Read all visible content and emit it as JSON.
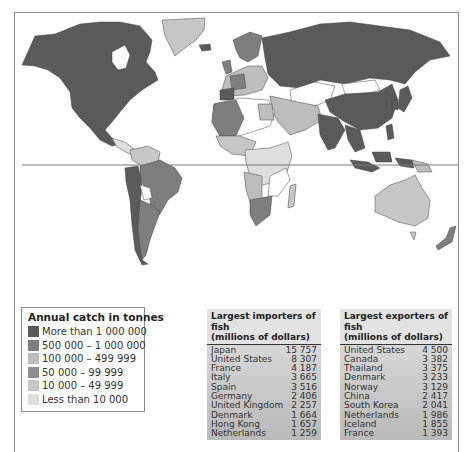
{
  "map": {
    "colors": {
      "more_than_1000000": "#5a5a5a",
      "500000_1000000": "#7e7e7e",
      "100000_499999": "#bdbdbd",
      "50000_99999": "#8f8f8f",
      "10000_49999": "#c6c6c6",
      "less_than_10000": "#dedede",
      "no_data": "#ffffff",
      "border": "#444444",
      "equator": "#7a7a7a"
    }
  },
  "legend": {
    "title": "Annual catch in tonnes",
    "items": [
      {
        "label": "More than 1 000 000",
        "color": "#5a5a5a"
      },
      {
        "label": "500 000 – 1 000 000",
        "color": "#7e7e7e"
      },
      {
        "label": "100 000 – 499 999",
        "color": "#bdbdbd"
      },
      {
        "label": "50 000 – 99 999",
        "color": "#8f8f8f"
      },
      {
        "label": "10 000 – 49 999",
        "color": "#c6c6c6"
      },
      {
        "label": "Less than 10 000",
        "color": "#dedede"
      }
    ]
  },
  "importers": {
    "title_line1": "Largest importers of fish",
    "title_line2": "(millions of dollars)",
    "rows": [
      {
        "country": "Japan",
        "value": "15 757"
      },
      {
        "country": "United States",
        "value": "8 307"
      },
      {
        "country": "France",
        "value": "4 187"
      },
      {
        "country": "Italy",
        "value": "3 665"
      },
      {
        "country": "Spain",
        "value": "3 516"
      },
      {
        "country": "Germany",
        "value": "2 406"
      },
      {
        "country": "United Kingdom",
        "value": "2 257"
      },
      {
        "country": "Denmark",
        "value": "1 664"
      },
      {
        "country": "Hong Kong",
        "value": "1 657"
      },
      {
        "country": "Netherlands",
        "value": "1 259"
      }
    ]
  },
  "exporters": {
    "title_line1": "Largest exporters of fish",
    "title_line2": "(millions of dollars)",
    "rows": [
      {
        "country": "United States",
        "value": "4 500"
      },
      {
        "country": "Canada",
        "value": "3 382"
      },
      {
        "country": "Thailand",
        "value": "3 375"
      },
      {
        "country": "Denmark",
        "value": "3 233"
      },
      {
        "country": "Norway",
        "value": "3 129"
      },
      {
        "country": "China",
        "value": "2 417"
      },
      {
        "country": "South Korea",
        "value": "2 041"
      },
      {
        "country": "Netherlands",
        "value": "1 986"
      },
      {
        "country": "Iceland",
        "value": "1 855"
      },
      {
        "country": "France",
        "value": "1 393"
      }
    ]
  }
}
